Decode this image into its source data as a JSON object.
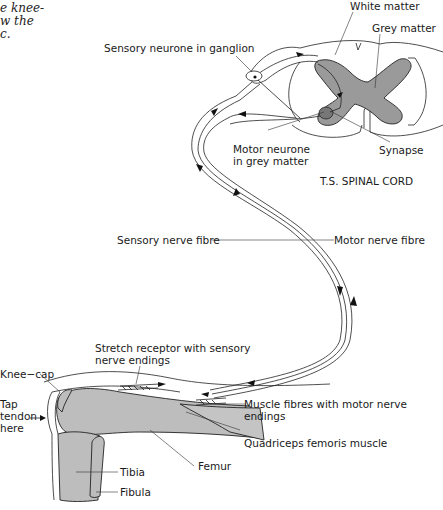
{
  "caption": {
    "lines": [
      "e knee-",
      "w the",
      "c."
    ]
  },
  "diagram": {
    "title": "T.S. SPINAL CORD",
    "labels": {
      "white_matter": "White matter",
      "grey_matter": "Grey matter",
      "sensory_neurone": "Sensory neurone in ganglion",
      "motor_neurone_1": "Motor neurone",
      "motor_neurone_2": "in grey matter",
      "synapse": "Synapse",
      "sensory_nerve_fibre": "Sensory nerve fibre",
      "motor_nerve_fibre": "Motor nerve fibre",
      "stretch_receptor_1": "Stretch receptor with sensory",
      "stretch_receptor_2": "nerve endings",
      "knee_cap": "Knee−cap",
      "tap_1": "Tap",
      "tap_2": "tendon",
      "tap_3": "here",
      "muscle_fibres_1": "Muscle fibres with motor nerve",
      "muscle_fibres_2": "endings",
      "quadriceps": "Quadriceps  femoris muscle",
      "femur": "Femur",
      "tibia": "Tibia",
      "fibula": "Fibula"
    },
    "colors": {
      "grey_matter": "#9a9a9a",
      "bone": "#bdbdbd",
      "line": "#222222"
    }
  }
}
